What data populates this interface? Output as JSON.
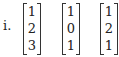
{
  "item_label": "i.",
  "vectors": [
    {
      "entries": [
        "1",
        "2",
        "3"
      ]
    },
    {
      "entries": [
        "1",
        "0",
        "1"
      ]
    },
    {
      "entries": [
        "1",
        "2",
        "1"
      ]
    }
  ]
}
